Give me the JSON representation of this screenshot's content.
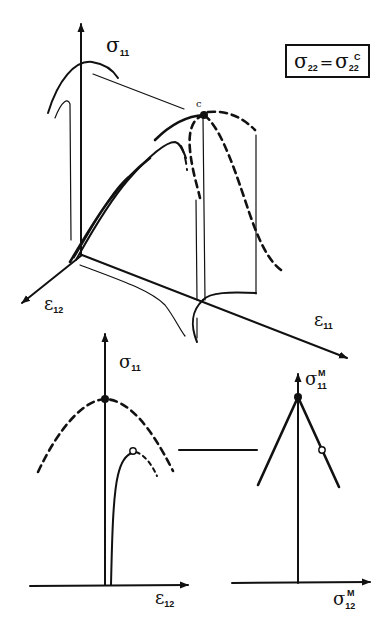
{
  "figure": {
    "legend_box": {
      "lhs": "σ",
      "lhs_sub": "22",
      "eq": "=",
      "rhs": "σ",
      "rhs_sub": "22",
      "rhs_sup": "C"
    },
    "plot3d": {
      "axis_vertical": {
        "symbol": "σ",
        "sub": "11"
      },
      "axis_left": {
        "symbol": "ε",
        "sub": "12"
      },
      "axis_right": {
        "symbol": "ε",
        "sub": "11"
      },
      "peak_label": "c"
    },
    "plot_left": {
      "axis_vertical": {
        "symbol": "σ",
        "sub": "11"
      },
      "axis_horizontal": {
        "symbol": "ε",
        "sub": "12"
      }
    },
    "plot_right": {
      "axis_vertical": {
        "symbol": "σ",
        "sub": "11",
        "sup": "M"
      },
      "axis_horizontal": {
        "symbol": "σ",
        "sub": "12",
        "sup": "M"
      }
    },
    "colors": {
      "ink": "#111111",
      "paper": "#ffffff"
    }
  }
}
